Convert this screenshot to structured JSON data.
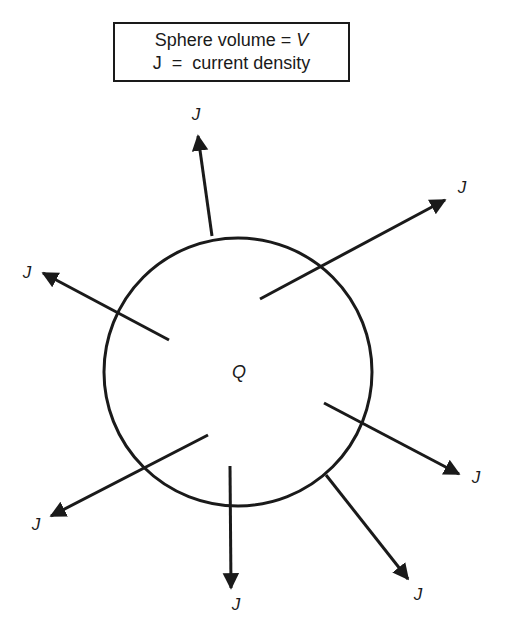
{
  "legend": {
    "line1_prefix": "Sphere volume = ",
    "line1_var": "V",
    "line2": "J  =  current density"
  },
  "center_label": "Q",
  "arrow_label": "J",
  "colors": {
    "stroke": "#1a1a1a",
    "background": "#ffffff"
  },
  "sphere": {
    "cx": 238,
    "cy": 372,
    "r": 134
  },
  "arrows": [
    {
      "name": "top",
      "x1": 212,
      "y1": 236,
      "x2": 198,
      "y2": 136,
      "label": "J",
      "lx": 196,
      "ly": 120
    },
    {
      "name": "upper-right",
      "x1": 260,
      "y1": 299,
      "x2": 445,
      "y2": 200,
      "label": "J",
      "lx": 462,
      "ly": 193
    },
    {
      "name": "left",
      "x1": 169,
      "y1": 340,
      "x2": 43,
      "y2": 273,
      "label": "J",
      "lx": 27,
      "ly": 278
    },
    {
      "name": "right",
      "x1": 324,
      "y1": 403,
      "x2": 459,
      "y2": 474,
      "label": "J",
      "lx": 476,
      "ly": 483
    },
    {
      "name": "lower-left",
      "x1": 208,
      "y1": 435,
      "x2": 51,
      "y2": 516,
      "label": "J",
      "lx": 36,
      "ly": 530
    },
    {
      "name": "bottom",
      "x1": 230,
      "y1": 466,
      "x2": 231,
      "y2": 588,
      "label": "J",
      "lx": 236,
      "ly": 610
    },
    {
      "name": "bottom-right",
      "x1": 326,
      "y1": 475,
      "x2": 408,
      "y2": 579,
      "label": "J",
      "lx": 418,
      "ly": 600
    }
  ]
}
